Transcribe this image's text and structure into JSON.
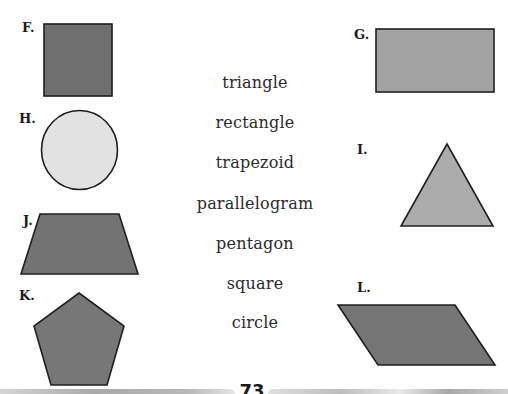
{
  "shapes": [
    {
      "label": "F.",
      "shape": "square",
      "fill": "#6f6f6f"
    },
    {
      "label": "G.",
      "shape": "rectangle",
      "fill": "#a3a3a3"
    },
    {
      "label": "H.",
      "shape": "circle",
      "fill": "#e2e2e2"
    },
    {
      "label": "I.",
      "shape": "triangle",
      "fill": "#acacac"
    },
    {
      "label": "J.",
      "shape": "trapezoid",
      "fill": "#737373"
    },
    {
      "label": "K.",
      "shape": "pentagon",
      "fill": "#777777"
    },
    {
      "label": "L.",
      "shape": "parallelogram",
      "fill": "#757575"
    }
  ],
  "word_list": [
    "triangle",
    "rectangle",
    "trapezoid",
    "parallelogram",
    "pentagon",
    "square",
    "circle"
  ],
  "page_number": "73",
  "colors": {
    "outline": "#1f1f1f",
    "text": "#2a2a2a"
  }
}
